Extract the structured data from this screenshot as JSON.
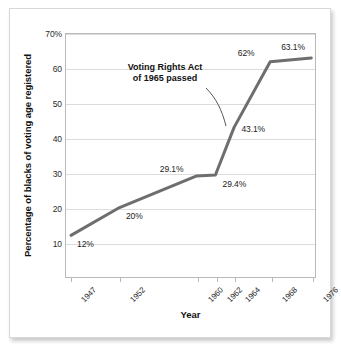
{
  "chart_data": {
    "type": "line",
    "title": "",
    "xlabel": "Year",
    "ylabel": "Percentage of blacks of voting age registered",
    "x": [
      "1947",
      "1952",
      "1960",
      "1962",
      "1964",
      "1968",
      "1976"
    ],
    "values": [
      12,
      20,
      29.1,
      29.4,
      43.1,
      62,
      63.1
    ],
    "point_labels": [
      "12%",
      "20%",
      "29.1%",
      "29.4%",
      "43.1%",
      "62%",
      "63.1%"
    ],
    "ylim": [
      0,
      70
    ],
    "yticks": [
      0,
      10,
      20,
      30,
      40,
      50,
      60,
      70
    ],
    "ytick_labels": [
      "",
      "10",
      "20",
      "30",
      "40",
      "50",
      "60",
      "70%"
    ],
    "grid": "horizontal",
    "legend": "none",
    "series_color": "#6e6e6e",
    "annotations": [
      {
        "text_line_1": "Voting Rights Act",
        "text_line_2": "of 1965 passed",
        "points_to": "1964"
      }
    ]
  },
  "figure": {
    "background": "#ffffff",
    "frame_color": "#b9b9b9",
    "grid_color": "#dcdcdc"
  }
}
